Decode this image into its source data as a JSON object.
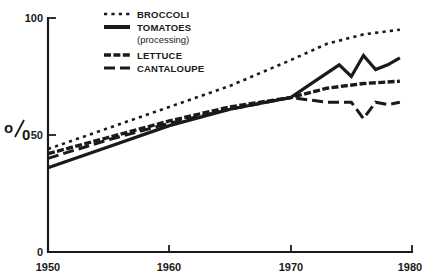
{
  "chart_data": {
    "type": "line",
    "title": "",
    "xlabel": "",
    "ylabel": "%",
    "xlim": [
      1950,
      1980
    ],
    "ylim": [
      0,
      100
    ],
    "xticks": [
      "1950",
      "1960",
      "1970",
      "1980"
    ],
    "yticks": [
      "0",
      "50",
      "100"
    ],
    "grid": false,
    "legend_position": "top-center",
    "series": [
      {
        "name": "BROCCOLI",
        "style": "dotted",
        "x": [
          1950,
          1955,
          1960,
          1965,
          1970,
          1973,
          1976,
          1979
        ],
        "values": [
          44,
          53,
          62,
          71,
          82,
          89,
          93,
          95
        ]
      },
      {
        "name": "TOMATOES",
        "sublabel": "(processing)",
        "style": "solid",
        "x": [
          1950,
          1955,
          1960,
          1965,
          1970,
          1972,
          1974,
          1975,
          1976,
          1977,
          1978,
          1979
        ],
        "values": [
          36,
          45,
          54,
          61,
          66,
          73,
          80,
          75,
          84,
          78,
          80,
          83
        ]
      },
      {
        "name": "LETTUCE",
        "style": "hatched-dash",
        "x": [
          1950,
          1955,
          1960,
          1965,
          1970,
          1973,
          1976,
          1979
        ],
        "values": [
          42,
          49,
          56,
          62,
          66,
          70,
          72,
          73
        ]
      },
      {
        "name": "CANTALOUPE",
        "style": "long-dash",
        "x": [
          1950,
          1955,
          1960,
          1965,
          1970,
          1973,
          1975,
          1976,
          1977,
          1978,
          1979
        ],
        "values": [
          40,
          48,
          55,
          61,
          66,
          64,
          64,
          57,
          64,
          63,
          64
        ]
      }
    ]
  },
  "axis": {
    "y_label": "%",
    "y_label_numerator": "o",
    "y_label_denominator": "0",
    "y_tick_100": "100",
    "y_tick_50": "50",
    "y_tick_0": "0",
    "x_tick_1950": "1950",
    "x_tick_1960": "1960",
    "x_tick_1970": "1970",
    "x_tick_1980": "1980"
  },
  "legend": {
    "items": [
      {
        "label": "BROCCOLI",
        "sublabel": ""
      },
      {
        "label": "TOMATOES",
        "sublabel": "(processing)"
      },
      {
        "label": "LETTUCE",
        "sublabel": ""
      },
      {
        "label": "CANTALOUPE",
        "sublabel": ""
      }
    ]
  },
  "colors": {
    "ink": "#1a1a1a",
    "background": "#ffffff"
  }
}
